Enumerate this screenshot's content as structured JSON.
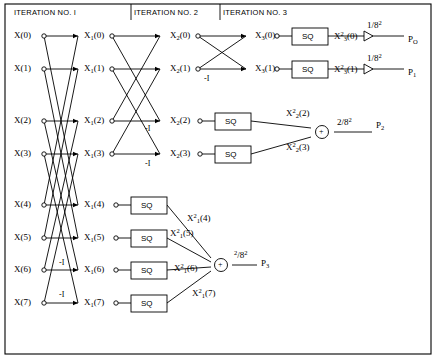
{
  "figure": {
    "headers": [
      {
        "text": "ITERATION NO. I",
        "x": 14,
        "y": 11
      },
      {
        "text": "ITERATION NO. 2",
        "x": 134,
        "y": 11
      },
      {
        "text": "ITERATION NO. 3",
        "x": 223,
        "y": 11
      }
    ],
    "inputs": [
      {
        "label": "X(0)",
        "x": 14,
        "y": 36
      },
      {
        "label": "X(1)",
        "x": 14,
        "y": 69
      },
      {
        "label": "X(2)",
        "x": 14,
        "y": 121
      },
      {
        "label": "X(3)",
        "x": 14,
        "y": 154
      },
      {
        "label": "X(4)",
        "x": 14,
        "y": 205
      },
      {
        "label": "X(5)",
        "x": 14,
        "y": 238
      },
      {
        "label": "X(6)",
        "x": 14,
        "y": 270
      },
      {
        "label": "X(7)",
        "x": 14,
        "y": 303
      }
    ],
    "stage1_labels": [
      {
        "base": "X",
        "sub": "1",
        "arg": "(0)",
        "x": 84,
        "y": 36
      },
      {
        "base": "X",
        "sub": "1",
        "arg": "(1)",
        "x": 84,
        "y": 69
      },
      {
        "base": "X",
        "sub": "1",
        "arg": "(2)",
        "x": 84,
        "y": 121
      },
      {
        "base": "X",
        "sub": "1",
        "arg": "(3)",
        "x": 84,
        "y": 154
      },
      {
        "base": "X",
        "sub": "1",
        "arg": "(4)",
        "x": 84,
        "y": 205
      },
      {
        "base": "X",
        "sub": "1",
        "arg": "(5)",
        "x": 84,
        "y": 238
      },
      {
        "base": "X",
        "sub": "1",
        "arg": "(6)",
        "x": 84,
        "y": 270
      },
      {
        "base": "X",
        "sub": "1",
        "arg": "(7)",
        "x": 84,
        "y": 303
      }
    ],
    "stage2_labels": [
      {
        "base": "X",
        "sub": "2",
        "arg": "(0)",
        "x": 170,
        "y": 36
      },
      {
        "base": "X",
        "sub": "2",
        "arg": "(1)",
        "x": 170,
        "y": 69
      },
      {
        "base": "X",
        "sub": "2",
        "arg": "(2)",
        "x": 170,
        "y": 121
      },
      {
        "base": "X",
        "sub": "2",
        "arg": "(3)",
        "x": 170,
        "y": 154
      }
    ],
    "stage3_labels": [
      {
        "base": "X",
        "sub": "3",
        "arg": "(0)",
        "x": 255,
        "y": 36
      },
      {
        "base": "X",
        "sub": "3",
        "arg": "(1)",
        "x": 255,
        "y": 69
      }
    ],
    "sq_boxes": [
      {
        "label": "SQ",
        "x": 292,
        "y": 28,
        "w": 36,
        "h": 17
      },
      {
        "label": "SQ",
        "x": 292,
        "y": 61,
        "w": 36,
        "h": 17
      },
      {
        "label": "SQ",
        "x": 215,
        "y": 113,
        "w": 36,
        "h": 17
      },
      {
        "label": "SQ",
        "x": 215,
        "y": 146,
        "w": 36,
        "h": 17
      },
      {
        "label": "SQ",
        "x": 131,
        "y": 197,
        "w": 36,
        "h": 17
      },
      {
        "label": "SQ",
        "x": 131,
        "y": 230,
        "w": 36,
        "h": 17
      },
      {
        "label": "SQ",
        "x": 131,
        "y": 262,
        "w": 36,
        "h": 17
      },
      {
        "label": "SQ",
        "x": 131,
        "y": 295,
        "w": 36,
        "h": 17
      }
    ],
    "squared_labels": [
      {
        "base": "X",
        "sub": "3",
        "sup": "2",
        "arg": "(0)",
        "x": 337,
        "y": 36
      },
      {
        "base": "X",
        "sub": "3",
        "sup": "2",
        "arg": "(1)",
        "x": 337,
        "y": 69
      },
      {
        "base": "X",
        "sub": "2",
        "sup": "2",
        "arg": "(2)",
        "x": 286,
        "y": 113
      },
      {
        "base": "X",
        "sub": "2",
        "sup": "2",
        "arg": "(3)",
        "x": 286,
        "y": 147
      },
      {
        "base": "X",
        "sub": "1",
        "sup": "2",
        "arg": "(4)",
        "x": 187,
        "y": 218
      },
      {
        "base": "X",
        "sub": "1",
        "sup": "2",
        "arg": "(5)",
        "x": 170,
        "y": 233
      },
      {
        "base": "X",
        "sub": "1",
        "sup": "2",
        "arg": "(6)",
        "x": 174,
        "y": 268
      },
      {
        "base": "X",
        "sub": "1",
        "sup": "2",
        "arg": "(7)",
        "x": 192,
        "y": 293
      }
    ],
    "gain_labels": [
      {
        "num": "1/8",
        "sup": "2",
        "x": 369,
        "y": 25
      },
      {
        "num": "1/8",
        "sup": "2",
        "x": 369,
        "y": 58
      },
      {
        "num": "2/8",
        "sup": "2",
        "x": 339,
        "y": 121
      },
      {
        "num": "2",
        "mid": "/8",
        "sup2": "2",
        "x": 239,
        "y": 253
      }
    ],
    "adders": [
      {
        "symbol": "+",
        "x": 323,
        "y": 131
      },
      {
        "symbol": "+",
        "x": 222,
        "y": 264
      }
    ],
    "outputs": [
      {
        "base": "P",
        "sub": "O",
        "x": 410,
        "y": 40
      },
      {
        "base": "P",
        "sub": "1",
        "x": 410,
        "y": 73
      },
      {
        "base": "P",
        "sub": "2",
        "x": 378,
        "y": 126
      },
      {
        "base": "P",
        "sub": "3",
        "x": 263,
        "y": 264
      }
    ],
    "minus_signs": [
      {
        "text": "-I",
        "x": 206,
        "y": 78
      },
      {
        "text": "-I",
        "x": 147,
        "y": 128
      },
      {
        "text": "-I",
        "x": 147,
        "y": 163
      },
      {
        "text": "-I",
        "x": 61,
        "y": 262
      },
      {
        "text": "-I",
        "x": 61,
        "y": 294
      }
    ],
    "adder_gain_label": "2/8",
    "colors": {
      "line": "#000000",
      "background": "#ffffff",
      "text": "#000000"
    }
  }
}
